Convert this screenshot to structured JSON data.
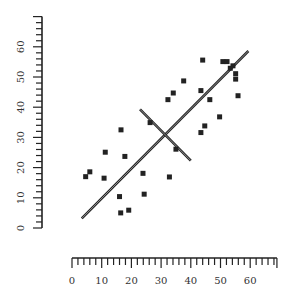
{
  "chart_data": {
    "type": "scatter",
    "title": "",
    "xlabel": "",
    "ylabel": "",
    "xlim": [
      0,
      69
    ],
    "ylim": [
      0,
      70
    ],
    "grid": false,
    "legend": null,
    "x_ticks": [
      0,
      10,
      20,
      30,
      40,
      50,
      60
    ],
    "y_ticks": [
      0,
      10,
      20,
      30,
      40,
      50,
      60
    ],
    "x_tick_labels": [
      "0",
      "10",
      "20",
      "30",
      "40",
      "50",
      "60"
    ],
    "y_tick_labels": [
      "0",
      "10",
      "20",
      "30",
      "40",
      "50",
      "60"
    ],
    "series": [
      {
        "name": "points",
        "marker": "square",
        "color": "#222222",
        "points": [
          [
            4.6,
            17.0
          ],
          [
            6.0,
            18.6
          ],
          [
            10.8,
            16.5
          ],
          [
            11.2,
            25.1
          ],
          [
            16.5,
            32.5
          ],
          [
            17.8,
            23.7
          ],
          [
            16.0,
            10.4
          ],
          [
            16.4,
            5.0
          ],
          [
            19.1,
            5.9
          ],
          [
            23.9,
            18.1
          ],
          [
            24.3,
            11.2
          ],
          [
            26.3,
            34.9
          ],
          [
            32.8,
            16.9
          ],
          [
            35.0,
            26.1
          ],
          [
            32.3,
            42.5
          ],
          [
            34.1,
            44.7
          ],
          [
            37.6,
            48.7
          ],
          [
            43.4,
            45.5
          ],
          [
            44.0,
            55.6
          ],
          [
            46.4,
            42.5
          ],
          [
            43.4,
            31.6
          ],
          [
            44.7,
            33.8
          ],
          [
            49.7,
            36.8
          ],
          [
            50.8,
            55.1
          ],
          [
            52.2,
            55.1
          ],
          [
            53.3,
            52.9
          ],
          [
            54.2,
            53.7
          ],
          [
            55.1,
            51.1
          ],
          [
            55.1,
            49.3
          ],
          [
            55.9,
            43.8
          ]
        ]
      }
    ],
    "annotations": [
      {
        "type": "line",
        "name": "principal-axis",
        "from": [
          3.3,
          3.2
        ],
        "to": [
          59.4,
          58.6
        ],
        "style": "double"
      },
      {
        "type": "line",
        "name": "perpendicular-axis",
        "from": [
          22.9,
          39.3
        ],
        "to": [
          40.0,
          22.3
        ],
        "style": "double"
      }
    ]
  },
  "colors": {
    "ink": "#222222",
    "background": "#ffffff"
  }
}
